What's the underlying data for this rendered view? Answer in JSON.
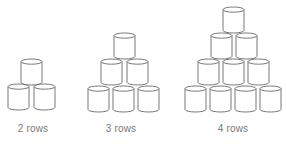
{
  "figure": {
    "stacks": [
      {
        "label": "2 rows",
        "rows": 2,
        "label_x": 33,
        "cans": [
          {
            "x": 21,
            "y": 59
          },
          {
            "x": 8,
            "y": 84
          },
          {
            "x": 34,
            "y": 84
          }
        ]
      },
      {
        "label": "3 rows",
        "rows": 3,
        "label_x": 121,
        "cans": [
          {
            "x": 114,
            "y": 33
          },
          {
            "x": 101,
            "y": 59
          },
          {
            "x": 127,
            "y": 59
          },
          {
            "x": 88,
            "y": 86
          },
          {
            "x": 113,
            "y": 86
          },
          {
            "x": 138,
            "y": 86
          }
        ]
      },
      {
        "label": "4 rows",
        "rows": 4,
        "label_x": 233,
        "cans": [
          {
            "x": 223,
            "y": 7
          },
          {
            "x": 211,
            "y": 33
          },
          {
            "x": 236,
            "y": 33
          },
          {
            "x": 198,
            "y": 59
          },
          {
            "x": 223,
            "y": 59
          },
          {
            "x": 248,
            "y": 59
          },
          {
            "x": 185,
            "y": 86
          },
          {
            "x": 210,
            "y": 86
          },
          {
            "x": 235,
            "y": 86
          },
          {
            "x": 260,
            "y": 86
          }
        ]
      }
    ],
    "can_width": 21,
    "can_height": 26,
    "label_y": 123,
    "stroke_color": "#6a6a6a",
    "label_color": "#7a7a7a"
  }
}
